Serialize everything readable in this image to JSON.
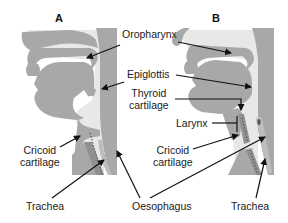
{
  "panels": {
    "a": {
      "label": "A"
    },
    "b": {
      "label": "B"
    }
  },
  "labels": {
    "oropharynx": "Oropharynx",
    "epiglottis": "Epiglottis",
    "thyroid_line1": "Thyroid",
    "thyroid_line2": "cartilage",
    "larynx": "Larynx",
    "cricoid_a_line1": "Cricoid",
    "cricoid_a_line2": "cartilage",
    "cricoid_b_line1": "Cricoid",
    "cricoid_b_line2": "cartilage",
    "trachea_a": "Trachea",
    "trachea_b": "Trachea",
    "oesophagus": "Oesophagus"
  },
  "colors": {
    "tissue": "#a6a6a6",
    "airway": "#e6e6e6",
    "outline": "#8c8c8c",
    "arrow": "#111111",
    "background": "#ffffff"
  }
}
